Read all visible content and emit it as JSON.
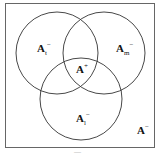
{
  "diagram": {
    "type": "venn",
    "universe_label": {
      "base": "A",
      "sup": "−"
    },
    "sets": [
      {
        "id": "t",
        "label": {
          "base": "A",
          "sub": "t",
          "sup": "−"
        },
        "cx": 57,
        "cy": 53,
        "r": 41
      },
      {
        "id": "m",
        "label": {
          "base": "A",
          "sub": "m",
          "sup": "−"
        },
        "cx": 104,
        "cy": 53,
        "r": 41
      },
      {
        "id": "l",
        "label": {
          "base": "A",
          "sub": "l",
          "sup": "−"
        },
        "cx": 81,
        "cy": 99,
        "r": 41
      }
    ],
    "center_label": {
      "base": "A",
      "sup": "+"
    },
    "caption": "—",
    "colors": {
      "stroke": "#333333",
      "border": "#666666",
      "background": "#ffffff"
    }
  }
}
